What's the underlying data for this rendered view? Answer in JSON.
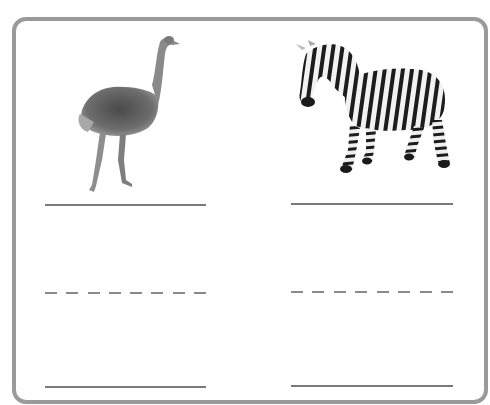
{
  "worksheet": {
    "type": "writing-practice",
    "panels": [
      {
        "animal": "ostrich",
        "image_icon": "ostrich-image",
        "lines": [
          "solid",
          "dashed",
          "solid"
        ]
      },
      {
        "animal": "zebra",
        "image_icon": "zebra-image",
        "lines": [
          "solid",
          "dashed",
          "solid"
        ]
      }
    ],
    "dash_count": 8,
    "colors": {
      "border": "#9a9a9a",
      "line": "#7a7a7a",
      "background": "#ffffff"
    }
  }
}
